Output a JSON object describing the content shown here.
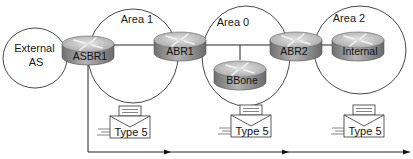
{
  "diagram": {
    "areas": [
      {
        "id": "external-as",
        "label_line1": "External",
        "label_line2": "AS"
      },
      {
        "id": "area-1",
        "label": "Area 1"
      },
      {
        "id": "area-0",
        "label": "Area 0"
      },
      {
        "id": "area-2",
        "label": "Area 2"
      }
    ],
    "routers": [
      {
        "id": "asbr1",
        "label": "ASBR1"
      },
      {
        "id": "abr1",
        "label": "ABR1"
      },
      {
        "id": "bbone",
        "label": "BBone"
      },
      {
        "id": "abr2",
        "label": "ABR2"
      },
      {
        "id": "internal",
        "label": "Internal"
      }
    ],
    "lsas": [
      {
        "label": "Type 5"
      },
      {
        "label": "Type 5"
      },
      {
        "label": "Type 5"
      }
    ],
    "colors": {
      "router_top": "#c8c8c8",
      "router_side": "#8a8a8a",
      "line": "#222222"
    }
  }
}
